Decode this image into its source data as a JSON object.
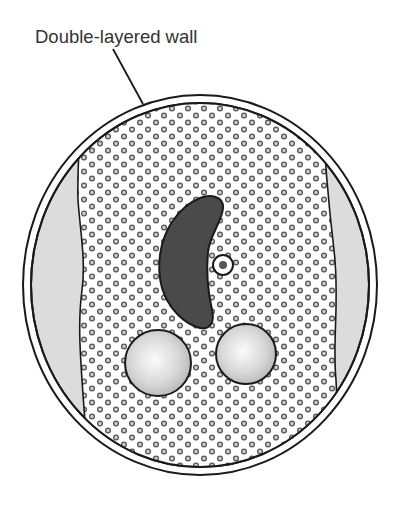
{
  "diagram": {
    "labels": [
      {
        "id": "wall",
        "text": "Double-layered wall"
      }
    ],
    "colors": {
      "outline": "#1a1a1a",
      "wall_fill": "#ffffff",
      "gap_fill": "#dcdcdc",
      "cytoplasm_fill": "#ffffff",
      "granule_stroke": "#555555",
      "granule_fill": "#cfcfcf",
      "nucleus_fill": "#4a4a4a",
      "sphere_light": "#f6f6f6",
      "sphere_dark": "#b9b9b9",
      "label_text": "#333333"
    },
    "structures": [
      "double-layered wall",
      "periplasmic gap",
      "granular cytoplasm",
      "kidney-shaped nucleus",
      "small ringed organelle",
      "two spherical bodies"
    ]
  }
}
